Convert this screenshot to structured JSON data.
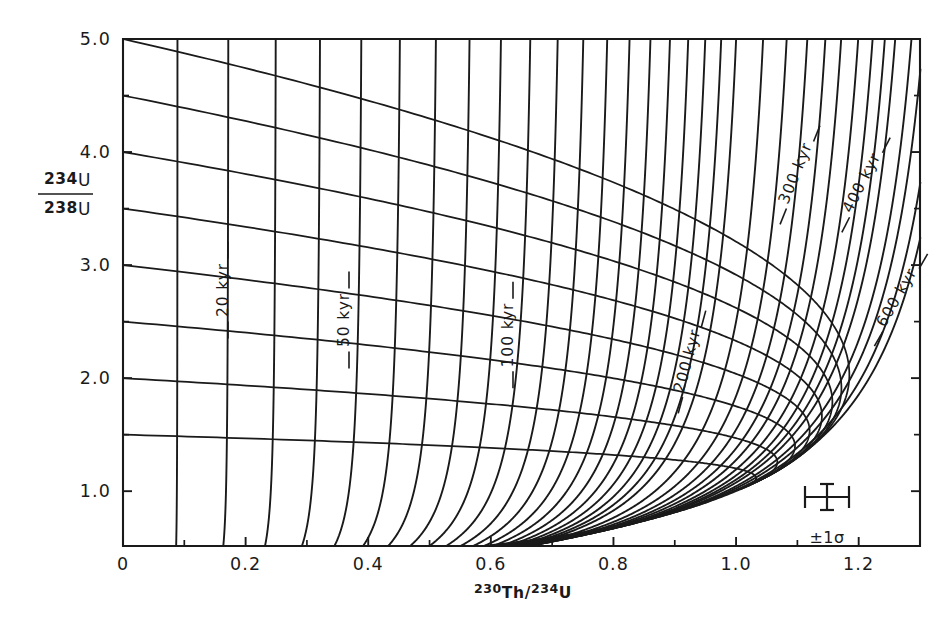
{
  "figure": {
    "kind": "u-series-isochron-diagram",
    "background_color": "#ffffff",
    "ink_color": "#1a1a1a"
  },
  "axes": {
    "x": {
      "title_parts": {
        "mass1": "230",
        "el1": "Th",
        "slash": "/",
        "mass2": "234",
        "el2": "U"
      },
      "title_plain": "230Th/234U",
      "tick_labels": [
        "0",
        "0.2",
        "0.4",
        "0.6",
        "0.8",
        "1.0",
        "1.2"
      ],
      "tick_values": [
        0,
        0.2,
        0.4,
        0.6,
        0.8,
        1.0,
        1.2
      ],
      "range": [
        0,
        1.3
      ],
      "minor_tick_values": [
        0.1,
        0.3,
        0.5,
        0.7,
        0.9,
        1.1
      ]
    },
    "y": {
      "title_numerator_mass": "234",
      "title_numerator_el": "U",
      "title_denominator_mass": "238",
      "title_denominator_el": "U",
      "title_plain": "234U/238U",
      "tick_labels": [
        "1.0",
        "2.0",
        "3.0",
        "4.0",
        "5.0"
      ],
      "tick_values": [
        1.0,
        2.0,
        3.0,
        4.0,
        5.0
      ],
      "range": [
        0.515,
        5.0
      ],
      "minor_tick_values": [
        1.5,
        2.5,
        3.5,
        4.5
      ]
    }
  },
  "chart_data": {
    "type": "line",
    "title": "",
    "xlabel": "230Th/234U",
    "ylabel": "234U/238U",
    "xlim": [
      0,
      1.3
    ],
    "ylim": [
      0.515,
      5.0
    ],
    "grid": false,
    "legend": "none",
    "isochron_ages_kyr": [
      10,
      20,
      30,
      40,
      50,
      60,
      70,
      80,
      90,
      100,
      110,
      120,
      130,
      140,
      150,
      160,
      170,
      180,
      190,
      200,
      220,
      240,
      260,
      280,
      300,
      325,
      350,
      375,
      400,
      450,
      500,
      600,
      800
    ],
    "labeled_isochrons": [
      {
        "label": "20 kyr",
        "age_kyr": 20
      },
      {
        "label": "50 kyr",
        "age_kyr": 50
      },
      {
        "label": "100 kyr",
        "age_kyr": 100
      },
      {
        "label": "200 kyr",
        "age_kyr": 200
      },
      {
        "label": "300 kyr",
        "age_kyr": 300
      },
      {
        "label": "400 kyr",
        "age_kyr": 400
      },
      {
        "label": "600 kyr",
        "age_kyr": 600
      }
    ],
    "initial_ratio_contours": [
      1.5,
      2.0,
      2.5,
      3.0,
      3.5,
      4.0,
      4.5,
      5.0
    ],
    "decay_constants": {
      "lambda_230": 9.195e-06,
      "lambda_234": 2.8263e-06
    },
    "units": "kyr"
  },
  "curve_labels": [
    {
      "id": "label-20kyr",
      "text": "20 kyr",
      "x": 228,
      "y": 290,
      "rotation": -90
    },
    {
      "id": "label-50kyr",
      "text": "50 kyr",
      "x": 349,
      "y": 320,
      "rotation": -90
    },
    {
      "id": "label-100kyr",
      "text": "100 kyr",
      "x": 513,
      "y": 335,
      "rotation": -90
    },
    {
      "id": "label-200kyr",
      "text": "200 kyr",
      "x": 692,
      "y": 362,
      "rotation": -75
    },
    {
      "id": "label-300kyr",
      "text": "300 kyr",
      "x": 800,
      "y": 175,
      "rotation": -68
    },
    {
      "id": "label-400kyr",
      "text": "400 kyr",
      "x": 866,
      "y": 185,
      "rotation": -63
    },
    {
      "id": "label-600kyr",
      "text": "600 kyr",
      "x": 901,
      "y": 300,
      "rotation": -60
    }
  ],
  "error_marker": {
    "label": "±1σ",
    "center_x": 827,
    "center_y": 497,
    "half_width": 22,
    "half_height": 13,
    "label_x": 827,
    "label_y": 543
  }
}
